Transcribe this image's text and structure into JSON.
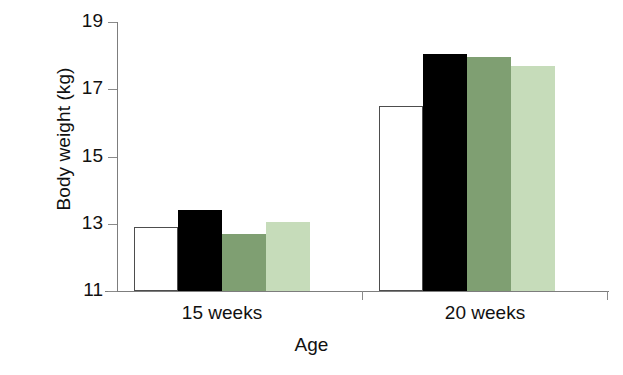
{
  "chart_data": {
    "type": "bar",
    "title": "",
    "xlabel": "Age",
    "ylabel": "Body weight (kg)",
    "categories": [
      "15 weeks",
      "20 weeks"
    ],
    "ylim": [
      11,
      19
    ],
    "yticks": [
      11,
      13,
      15,
      17,
      19
    ],
    "ytick_labels": [
      "11",
      "13",
      "15",
      "17",
      "19"
    ],
    "grid": false,
    "legend": "none",
    "series": [
      {
        "name": "group-1",
        "color": "#ffffff",
        "edge": "#4d4d4d",
        "values": [
          12.9,
          16.5
        ]
      },
      {
        "name": "group-2",
        "color": "#000000",
        "edge": "#000000",
        "values": [
          13.4,
          18.05
        ]
      },
      {
        "name": "group-3",
        "color": "#7f9f72",
        "edge": "#7f9f72",
        "values": [
          12.7,
          17.95
        ]
      },
      {
        "name": "group-4",
        "color": "#c6dcba",
        "edge": "#c6dcba",
        "values": [
          13.05,
          17.7
        ]
      }
    ]
  },
  "axis": {
    "y_title": "Body weight (kg)",
    "x_title": "Age",
    "y_tick_0": "11",
    "y_tick_1": "13",
    "y_tick_2": "15",
    "y_tick_3": "17",
    "y_tick_4": "19",
    "x_tick_0": "15 weeks",
    "x_tick_1": "20 weeks"
  }
}
